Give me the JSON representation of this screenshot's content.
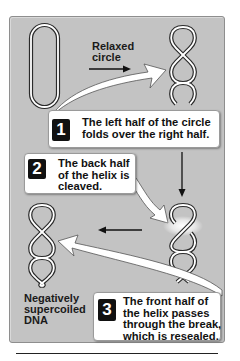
{
  "figure": {
    "labels": {
      "relaxed_circle": [
        "Relaxed",
        "circle"
      ],
      "negatively_supercoiled": [
        "Negatively",
        "supercoiled",
        "DNA"
      ]
    },
    "steps": [
      {
        "number": "1",
        "lines": [
          "The left half of the circle",
          "folds over the right half."
        ]
      },
      {
        "number": "2",
        "lines": [
          "The back half",
          "of the helix is",
          "cleaved."
        ]
      },
      {
        "number": "3",
        "lines": [
          "The front half of",
          "the helix passes",
          "through the break,",
          "which is resealed."
        ]
      }
    ],
    "colors": {
      "panel": "#c3c3c3",
      "box": "#ffffff",
      "badge": "#111111",
      "strand_outline": "#222222"
    },
    "icons": [
      "relaxed-circle-icon",
      "supercoil-helix-icon",
      "cleaved-helix-icon",
      "negative-supercoil-icon",
      "arrow-right-icon",
      "arrow-down-icon",
      "arrow-left-icon",
      "curved-callout-arrow-icon"
    ]
  }
}
